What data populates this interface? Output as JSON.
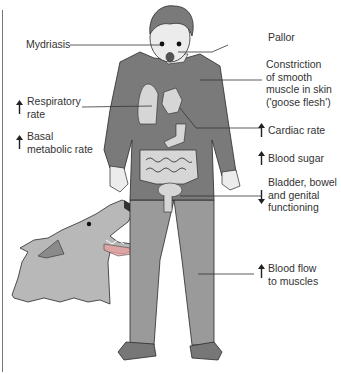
{
  "figure": {
    "colors": {
      "clothing": "#7a7a7a",
      "trousers": "#9a9a9a",
      "skin": "#ececec",
      "organs": "#d6d6d6",
      "dog": "#b8b8b8",
      "outline": "#2a2a2a",
      "text": "#333333"
    }
  },
  "labels": {
    "mydriasis": {
      "text": "Mydriasis",
      "direction": "none"
    },
    "pallor": {
      "text": "Pallor",
      "direction": "none"
    },
    "goose_flesh": {
      "lines": [
        "Constriction",
        "of smooth",
        "muscle in skin",
        "('goose flesh')"
      ],
      "direction": "none"
    },
    "respiratory_rate": {
      "lines": [
        "Respiratory",
        "rate"
      ],
      "direction": "up",
      "arrow_icon": "up-arrow-icon"
    },
    "basal_metabolic_rate": {
      "lines": [
        "Basal",
        "metabolic rate"
      ],
      "direction": "up",
      "arrow_icon": "up-arrow-icon"
    },
    "cardiac_rate": {
      "text": "Cardiac rate",
      "direction": "up",
      "arrow_icon": "up-arrow-icon"
    },
    "blood_sugar": {
      "text": "Blood sugar",
      "direction": "up",
      "arrow_icon": "up-arrow-icon"
    },
    "bladder": {
      "lines": [
        "Bladder, bowel",
        "and genital",
        "functioning"
      ],
      "direction": "down",
      "arrow_icon": "down-arrow-icon"
    },
    "blood_flow": {
      "lines": [
        "Blood flow",
        "to muscles"
      ],
      "direction": "up",
      "arrow_icon": "up-arrow-icon"
    }
  }
}
